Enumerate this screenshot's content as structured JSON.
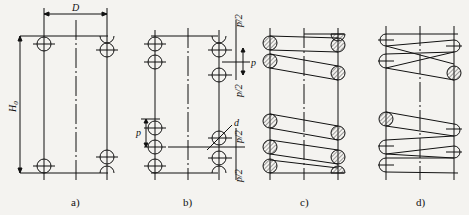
{
  "figure": {
    "panels": [
      {
        "id": "a",
        "label": "a)",
        "dims": {
          "diameter": "D",
          "free_height": "H0"
        }
      },
      {
        "id": "b",
        "label": "b)",
        "dims": {
          "pitch": "p",
          "half_pitch": "p/2",
          "wire_diameter": "d"
        }
      },
      {
        "id": "c",
        "label": "c)",
        "style": "section view with hatched coils"
      },
      {
        "id": "d",
        "label": "d)",
        "style": "outline view"
      }
    ]
  },
  "labels": {
    "a": "a)",
    "b": "b)",
    "c": "c)",
    "d": "d)",
    "D": "D",
    "H": "H",
    "H_sub": "0",
    "p": "p",
    "p2": "p/2",
    "d_wire": "d"
  },
  "colors": {
    "ink": "#111111",
    "background": "#f4f3f0",
    "hatch": "#555555"
  }
}
